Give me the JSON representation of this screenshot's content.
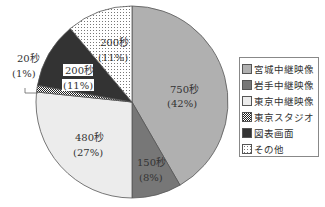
{
  "chart_data": {
    "type": "pie",
    "title": "",
    "unit": "秒",
    "categories": [
      "宮城中継映像",
      "岩手中継映像",
      "東京中継映像",
      "東京スタジオ",
      "図表画面",
      "その他"
    ],
    "values": [
      750,
      150,
      480,
      20,
      200,
      200
    ],
    "percent": [
      42,
      8,
      27,
      1,
      11,
      11
    ],
    "labels": [
      "750秒\n(42%)",
      "150秒\n(8%)",
      "480秒\n(27%)",
      "20秒\n(1%)",
      "200秒\n(11%)",
      "200秒\n(11%)"
    ],
    "colors": [
      "#b0b0b0",
      "#777777",
      "#ececec",
      "checker",
      "#333333",
      "dotted"
    ],
    "start_angle": "12 o'clock, clockwise",
    "legend_position": "right"
  },
  "labels": {
    "miyagi_value": "750秒",
    "miyagi_pct": "(42%)",
    "iwate_value": "150秒",
    "iwate_pct": "(8%)",
    "tokyo_value": "480秒",
    "tokyo_pct": "(27%)",
    "studio_value": "20秒",
    "studio_pct": "(1%)",
    "chart_value": "200秒",
    "chart_pct": "(11%)",
    "other_value": "200秒",
    "other_pct": "(11%)"
  },
  "legend": {
    "items": [
      "宮城中継映像",
      "岩手中継映像",
      "東京中継映像",
      "東京スタジオ",
      "図表画面",
      "その他"
    ]
  }
}
